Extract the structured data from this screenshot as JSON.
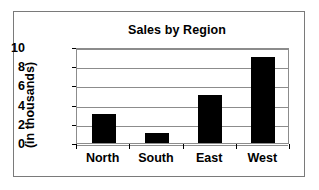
{
  "chart_data": {
    "type": "bar",
    "title": "Sales by Region",
    "xlabel": "",
    "ylabel": "(in thousands)",
    "categories": [
      "North",
      "South",
      "East",
      "West"
    ],
    "values": [
      3,
      1,
      5,
      9
    ],
    "yticks": [
      0,
      2,
      4,
      6,
      8,
      10
    ],
    "ylim": [
      0,
      10
    ],
    "grid": true,
    "legend": false,
    "series": [
      {
        "name": "Sales",
        "values": [
          3,
          1,
          5,
          9
        ],
        "color": "#000000"
      }
    ]
  },
  "style": {
    "bar_color": "#000000",
    "grid_color": "#8c8c8c",
    "axis_color": "#000000",
    "border_color": "#7a7a7a",
    "background": "#ffffff"
  }
}
